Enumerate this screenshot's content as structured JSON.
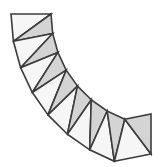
{
  "figure": {
    "type": "geometric-diagram",
    "background_color": "#ffffff",
    "canvas": {
      "width": 162,
      "height": 167
    }
  },
  "style": {
    "stroke_color": "#3c3c3c",
    "stroke_width": 1.6,
    "fill_shaded": "#d4d4d4",
    "fill_unshaded": "#f6f6f6"
  },
  "geometry": {
    "arc": {
      "center_x": 151,
      "center_y": 14,
      "outer_radius": 140,
      "inner_radius": 100,
      "start_angle_deg": 180,
      "end_angle_deg": 90,
      "segment_count": 8
    },
    "outer_points": [
      {
        "x": 11.0,
        "y": 14.0
      },
      {
        "x": 13.4,
        "y": 41.3
      },
      {
        "x": 20.6,
        "y": 67.7
      },
      {
        "x": 32.3,
        "y": 92.5
      },
      {
        "x": 48.0,
        "y": 114.9
      },
      {
        "x": 67.4,
        "y": 134.2
      },
      {
        "x": 89.7,
        "y": 149.8
      },
      {
        "x": 114.4,
        "y": 161.3
      },
      {
        "x": 151.0,
        "y": 154.0
      }
    ],
    "inner_points": [
      {
        "x": 51.0,
        "y": 14.0
      },
      {
        "x": 52.7,
        "y": 33.5
      },
      {
        "x": 57.9,
        "y": 52.4
      },
      {
        "x": 66.2,
        "y": 70.1
      },
      {
        "x": 77.5,
        "y": 86.1
      },
      {
        "x": 91.3,
        "y": 99.8
      },
      {
        "x": 107.2,
        "y": 111.0
      },
      {
        "x": 124.8,
        "y": 119.2
      },
      {
        "x": 151.0,
        "y": 114.0
      }
    ],
    "triangles": [
      {
        "id": "t1",
        "shade": "unshaded",
        "vertices": "outer0,inner0,outer1"
      },
      {
        "id": "t2",
        "shade": "shaded",
        "vertices": "inner0,outer1,inner1"
      },
      {
        "id": "t3",
        "shade": "unshaded",
        "vertices": "inner1,outer1,outer2"
      },
      {
        "id": "t4",
        "shade": "shaded",
        "vertices": "inner1,outer2,inner2"
      },
      {
        "id": "t5",
        "shade": "unshaded",
        "vertices": "inner2,outer2,outer3"
      },
      {
        "id": "t6",
        "shade": "shaded",
        "vertices": "inner2,outer3,inner3"
      },
      {
        "id": "t7",
        "shade": "unshaded",
        "vertices": "inner3,outer3,outer4"
      },
      {
        "id": "t8",
        "shade": "shaded",
        "vertices": "inner3,outer4,inner4"
      },
      {
        "id": "t9",
        "shade": "unshaded",
        "vertices": "inner4,outer4,outer5"
      },
      {
        "id": "t10",
        "shade": "shaded",
        "vertices": "inner4,outer5,inner5"
      },
      {
        "id": "t11",
        "shade": "unshaded",
        "vertices": "inner5,outer5,outer6"
      },
      {
        "id": "t12",
        "shade": "shaded",
        "vertices": "inner5,outer6,inner6"
      },
      {
        "id": "t13",
        "shade": "unshaded",
        "vertices": "inner6,outer6,outer7"
      },
      {
        "id": "t14",
        "shade": "shaded",
        "vertices": "inner6,outer7,inner7"
      },
      {
        "id": "t15",
        "shade": "unshaded",
        "vertices": "inner7,outer7,outer8"
      },
      {
        "id": "t16",
        "shade": "shaded",
        "vertices": "inner7,outer8,inner8"
      }
    ]
  }
}
